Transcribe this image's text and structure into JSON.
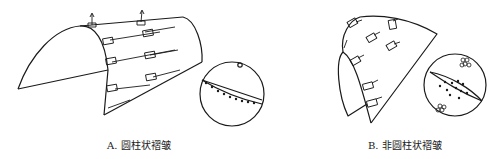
{
  "figure": {
    "panels": [
      {
        "id": "A",
        "caption": "A. 圆柱状褶皱",
        "shape": "cylindrical-fold-surface",
        "stereonet": {
          "pattern": "great-circle-girdle",
          "pole_marker": "single-open-circle"
        }
      },
      {
        "id": "B",
        "caption": "B. 非圆柱状褶皱",
        "shape": "non-cylindrical-fold-surface",
        "stereonet": {
          "pattern": "scattered-points-with-girdle",
          "pole_marker": "clustered-open-circles"
        }
      }
    ],
    "colors": {
      "line": "#1a1a1a",
      "background": "#ffffff"
    }
  }
}
